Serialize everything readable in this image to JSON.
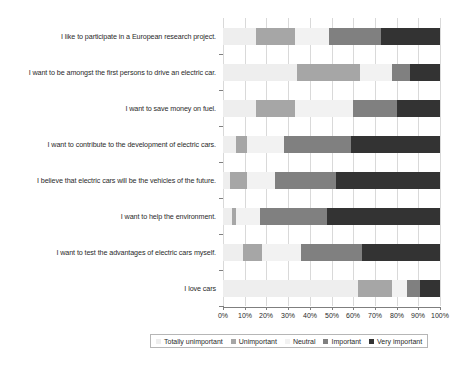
{
  "chart_data": {
    "type": "bar",
    "orientation": "horizontal",
    "stacked": true,
    "stacked_normalized": true,
    "title": "",
    "xlabel": "",
    "ylabel": "",
    "xlim": [
      0,
      100
    ],
    "xticks": [
      "0%",
      "10%",
      "20%",
      "30%",
      "40%",
      "50%",
      "60%",
      "70%",
      "80%",
      "90%",
      "100%"
    ],
    "grid": true,
    "legend_position": "bottom",
    "categories": [
      "I like to participate in a European research project.",
      "I want to be amongst the first persons to drive an electric car.",
      "I want to save money on fuel.",
      "I want to contribute to the development of electric cars.",
      "I believe that electric cars will be the vehicles of the future.",
      "I want to help the environment.",
      "I want to test the advantages of electric cars myself.",
      "I love cars"
    ],
    "series": [
      {
        "name": "Totally unimportant",
        "color": "#eeeeee",
        "values": [
          15,
          34,
          15,
          6,
          3,
          4,
          9,
          62
        ]
      },
      {
        "name": "Unimportant",
        "color": "#a6a6a6",
        "values": [
          18,
          29,
          18,
          5,
          8,
          2,
          9,
          16
        ]
      },
      {
        "name": "Neutral",
        "color": "#f2f2f2",
        "values": [
          16,
          15,
          27,
          17,
          13,
          11,
          18,
          7
        ]
      },
      {
        "name": "Important",
        "color": "#808080",
        "values": [
          24,
          8,
          20,
          31,
          28,
          31,
          28,
          6
        ]
      },
      {
        "name": "Very important",
        "color": "#333333",
        "values": [
          27,
          14,
          20,
          41,
          48,
          52,
          36,
          9
        ]
      }
    ]
  }
}
